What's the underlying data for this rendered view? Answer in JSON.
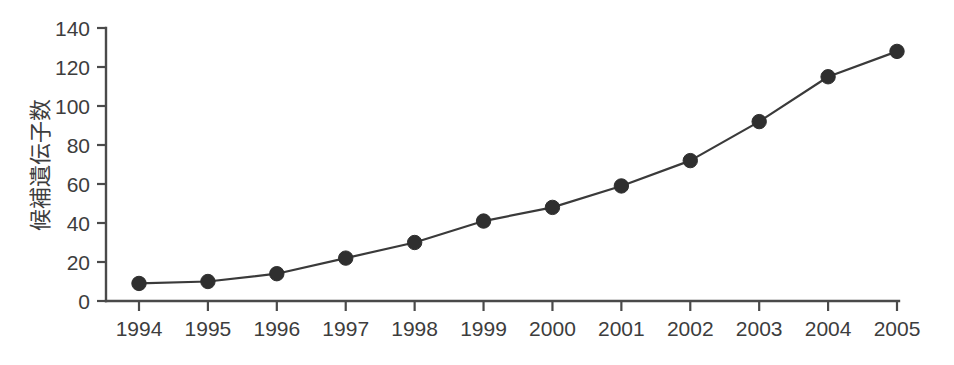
{
  "chart_data": {
    "type": "line",
    "title": "",
    "xlabel": "",
    "ylabel": "候補遺伝子数",
    "categories": [
      "1994",
      "1995",
      "1996",
      "1997",
      "1998",
      "1999",
      "2000",
      "2001",
      "2002",
      "2003",
      "2004",
      "2005"
    ],
    "values": [
      9,
      10,
      14,
      22,
      30,
      41,
      48,
      59,
      72,
      92,
      115,
      128
    ],
    "series": [
      {
        "name": "候補遺伝子数",
        "values": [
          9,
          10,
          14,
          22,
          30,
          41,
          48,
          59,
          72,
          92,
          115,
          128
        ]
      }
    ],
    "ylim": [
      0,
      140
    ],
    "yticks": [
      0,
      20,
      40,
      60,
      80,
      100,
      120,
      140
    ],
    "ytick_labels": [
      "0",
      "20",
      "40",
      "60",
      "80",
      "100",
      "120",
      "140"
    ],
    "xtick_labels": [
      "1994",
      "1995",
      "1996",
      "1997",
      "1998",
      "1999",
      "2000",
      "2001",
      "2002",
      "2003",
      "2004",
      "2005"
    ],
    "grid": false,
    "legend": false,
    "marker": "filled-circle",
    "line_color": "#3a3a3a",
    "marker_color": "#2f2f2f",
    "axis_color": "#4a4a4a",
    "background_color": "#ffffff"
  },
  "axes": {
    "y_axis_name": "y-axis",
    "x_axis_name": "x-axis"
  }
}
